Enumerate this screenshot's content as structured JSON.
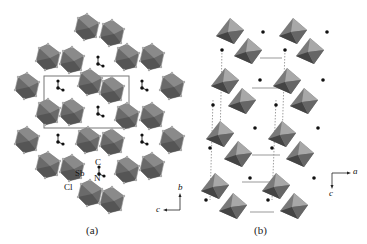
{
  "figure": {
    "panels": [
      {
        "id": "a",
        "caption": "(a)",
        "atom_labels": {
          "sb": "Sb",
          "cl": "Cl",
          "n": "N",
          "c": "C"
        },
        "axes": {
          "vertical": "b",
          "horizontal": "c"
        }
      },
      {
        "id": "b",
        "caption": "(b)",
        "axes": {
          "horizontal": "a",
          "vertical": "c"
        }
      }
    ],
    "colors": {
      "octahedron_dark": "#5a5a5a",
      "octahedron_mid": "#7a7a7a",
      "octahedron_light": "#a8a8a8",
      "atom": "#111111",
      "bond": "#999999"
    }
  }
}
